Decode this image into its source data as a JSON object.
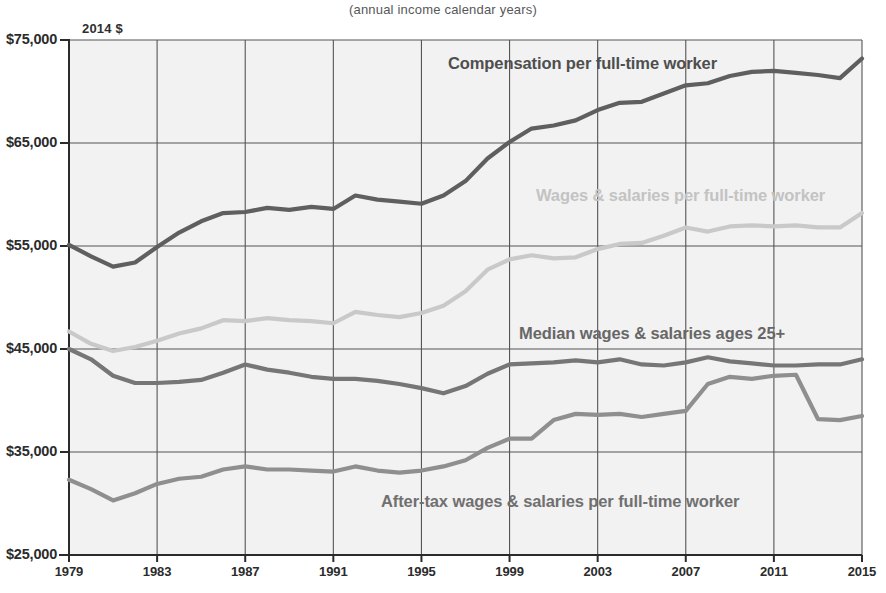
{
  "chart_data": {
    "type": "line",
    "title": "",
    "subtitle": "(annual  income calendar years)",
    "units_note": "2014 $",
    "xlabel": "",
    "ylabel": "",
    "xlim": [
      1979,
      2015
    ],
    "ylim": [
      25000,
      75000
    ],
    "grid": true,
    "legend_position": "inline-annotations",
    "y_ticks": [
      25000,
      35000,
      45000,
      55000,
      65000,
      75000
    ],
    "y_tick_labels": [
      "$25,000",
      "$35,000",
      "$45,000",
      "$55,000",
      "$65,000",
      "$75,000"
    ],
    "x_ticks": [
      1979,
      1983,
      1987,
      1991,
      1995,
      1999,
      2003,
      2007,
      2011,
      2015
    ],
    "x_tick_labels": [
      "1979",
      "1983",
      "1987",
      "1991",
      "1995",
      "1999",
      "2003",
      "2007",
      "2011",
      "2015"
    ],
    "x": [
      1979,
      1980,
      1981,
      1982,
      1983,
      1984,
      1985,
      1986,
      1987,
      1988,
      1989,
      1990,
      1991,
      1992,
      1993,
      1994,
      1995,
      1996,
      1997,
      1998,
      1999,
      2000,
      2001,
      2002,
      2003,
      2004,
      2005,
      2006,
      2007,
      2008,
      2009,
      2010,
      2011,
      2012,
      2013,
      2014,
      2015
    ],
    "series": [
      {
        "name": "Compensation per full-time worker",
        "color": "#5f5f5f",
        "label_color": "#4e4e4e",
        "values": [
          55100,
          54000,
          53000,
          53400,
          54900,
          56300,
          57400,
          58200,
          58300,
          58700,
          58500,
          58800,
          58600,
          59900,
          59500,
          59300,
          59100,
          59900,
          61300,
          63500,
          65100,
          66400,
          66700,
          67200,
          68200,
          68900,
          69000,
          69800,
          70600,
          70800,
          71500,
          71900,
          72000,
          71800,
          71600,
          71300,
          73200
        ]
      },
      {
        "name": "Wages & salaries per full-time worker",
        "color": "#c9c9c9",
        "label_color": "#c3c3c3",
        "values": [
          46700,
          45500,
          44800,
          45200,
          45800,
          46500,
          47000,
          47800,
          47700,
          48000,
          47800,
          47700,
          47500,
          48600,
          48300,
          48100,
          48500,
          49200,
          50600,
          52700,
          53700,
          54100,
          53800,
          53900,
          54700,
          55200,
          55300,
          56000,
          56800,
          56400,
          56900,
          57000,
          56900,
          57000,
          56800,
          56800,
          58200
        ]
      },
      {
        "name": "Median wages & salaries ages 25+",
        "color": "#767676",
        "label_color": "#676767",
        "values": [
          45000,
          44000,
          42400,
          41700,
          41700,
          41800,
          42000,
          42700,
          43500,
          43000,
          42700,
          42300,
          42100,
          42100,
          41900,
          41600,
          41200,
          40700,
          41400,
          42600,
          43500,
          43600,
          43700,
          43900,
          43700,
          44000,
          43500,
          43400,
          43700,
          44200,
          43800,
          43600,
          43400,
          43400,
          43500,
          43500,
          44000
        ]
      },
      {
        "name": "After-tax wages & salaries per full-time worker",
        "color": "#8f8f8f",
        "label_color": "#707070",
        "values": [
          32300,
          31400,
          30300,
          31000,
          31900,
          32400,
          32600,
          33300,
          33600,
          33300,
          33300,
          33200,
          33100,
          33600,
          33200,
          33000,
          33200,
          33600,
          34200,
          35400,
          36300,
          36300,
          38100,
          38700,
          38600,
          38700,
          38400,
          38700,
          39000,
          41600,
          42300,
          42100,
          42400,
          42500,
          38200,
          38100,
          38500
        ]
      }
    ],
    "annotations": [
      {
        "text": "Compensation per full-time worker",
        "series": 0,
        "style": "dark"
      },
      {
        "text": "Wages & salaries per full-time worker",
        "series": 1,
        "style": "light"
      },
      {
        "text": "Median wages & salaries ages 25+",
        "series": 2,
        "style": "mid"
      },
      {
        "text": "After-tax wages & salaries per full-time worker",
        "series": 3,
        "style": "mid2"
      }
    ]
  },
  "plot_geometry": {
    "left": 69,
    "right": 862,
    "top": 40,
    "bottom": 555
  },
  "annotation_positions": [
    {
      "left": 448,
      "top": 54
    },
    {
      "left": 536,
      "top": 186
    },
    {
      "left": 519,
      "top": 324
    },
    {
      "left": 381,
      "top": 492
    }
  ],
  "colors": {
    "grid": "#555555",
    "axis": "#2b2b2b",
    "plot_background": "#f2f2f2",
    "page_background": "#ffffff"
  }
}
